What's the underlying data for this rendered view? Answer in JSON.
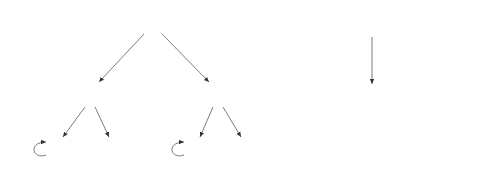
{
  "diagrams": [
    {
      "name": "left-tree",
      "nodes": [
        {
          "id": "q",
          "label": "q",
          "x": 153,
          "y": 24
        },
        {
          "id": "r1",
          "label": "r",
          "sub": "1",
          "x": 90,
          "y": 94
        },
        {
          "id": "r2",
          "label": "r",
          "sub": "2",
          "x": 218,
          "y": 94
        },
        {
          "id": "s1",
          "label": "s",
          "sub": "1",
          "x": 57,
          "y": 150
        },
        {
          "id": "s2",
          "label": "s",
          "sub": "2",
          "x": 114,
          "y": 150
        },
        {
          "id": "s3",
          "label": "s",
          "sub": "3",
          "x": 195,
          "y": 150
        },
        {
          "id": "s4",
          "label": "s",
          "sub": "4",
          "x": 246,
          "y": 150
        }
      ],
      "edges": [
        {
          "from": "q",
          "to": "r1",
          "action": "a",
          "prob_num": "1",
          "prob_den": "2",
          "suffix": ""
        },
        {
          "from": "q",
          "to": "r2",
          "action": "a",
          "prob_num": "1",
          "prob_den": "2",
          "suffix": ""
        },
        {
          "from": "r1",
          "to": "s1",
          "action": "a",
          "prob_num": "2",
          "prob_den": "3",
          "suffix": "+ ε₁"
        },
        {
          "from": "r1",
          "to": "s2",
          "action": "a",
          "prob_num": "1",
          "prob_den": "3",
          "suffix": "− ε₁"
        },
        {
          "from": "r2",
          "to": "s3",
          "action": "a",
          "prob_num": "1",
          "prob_den": "3",
          "suffix": "− ε₂"
        },
        {
          "from": "r2",
          "to": "s4",
          "action": "a",
          "prob_num": "2",
          "prob_den": "3",
          "suffix": "+ ε₂"
        }
      ],
      "self_loops": [
        {
          "node": "s1",
          "label": "a"
        },
        {
          "node": "s3",
          "label": "a"
        }
      ]
    },
    {
      "name": "right-tree",
      "nodes": [
        {
          "id": "q'",
          "label": "q′",
          "x": 372,
          "y": 24
        },
        {
          "id": "r'",
          "label": "r′",
          "x": 372,
          "y": 98
        },
        {
          "id": "s1'",
          "label": "s′",
          "sub": "1",
          "x": 377,
          "y": 148
        },
        {
          "id": "s2'",
          "label": "s′",
          "sub": "2",
          "x": 437,
          "y": 148
        }
      ],
      "edges": [
        {
          "from": "q'",
          "to": "r'",
          "action": "a",
          "prob": "1"
        },
        {
          "from": "r'",
          "to": "s1'",
          "action": "a",
          "prob_num": "1",
          "prob_den": "2"
        },
        {
          "from": "r'",
          "to": "s2'",
          "action": "a",
          "prob_num": "1",
          "prob_den": "2"
        }
      ],
      "self_loops": [
        {
          "node": "s1'",
          "label": "a"
        }
      ]
    }
  ],
  "labels": {
    "q_r1": {
      "a": "a,",
      "num": "1",
      "den": "2"
    },
    "q_r2": {
      "a": "a,",
      "num": "1",
      "den": "2"
    },
    "r1_s1": {
      "a": "a,",
      "num": "2",
      "den": "3",
      "suffix": "+ ε₁"
    },
    "r1_s2": {
      "a": "a,",
      "num": "1",
      "den": "3",
      "suffix": "− ε₁"
    },
    "r2_s3": {
      "a": "a,",
      "num": "1",
      "den": "3",
      "suffix": "− ε₂"
    },
    "r2_s4": {
      "a": "a,",
      "num": "2",
      "den": "3",
      "suffix": "+ ε₂"
    },
    "loop_s1": "a",
    "loop_s3": "a",
    "qp_rp": {
      "a": "a,",
      "p": "1"
    },
    "rp_s1p": {
      "a": "a,",
      "num": "1",
      "den": "2"
    },
    "rp_s2p": {
      "a": "a,",
      "num": "1",
      "den": "2"
    },
    "loop_s1p": "a",
    "node_q": "q",
    "node_r": "r",
    "node_s": "s",
    "node_qp": "q′",
    "node_rp": "r′",
    "node_sp": "s′",
    "sub1": "1",
    "sub2": "2",
    "sub3": "3",
    "sub4": "4"
  }
}
